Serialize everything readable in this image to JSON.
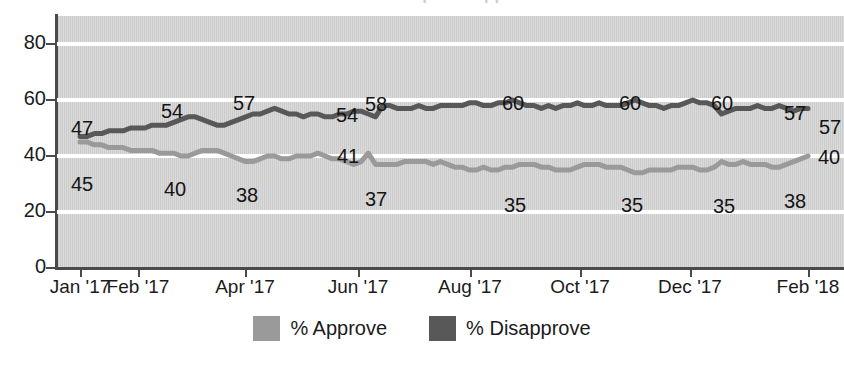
{
  "title_sliver": "President Trump Job Approval",
  "chart_data": {
    "type": "line",
    "title": "President Trump Job Approval",
    "xlabel": "",
    "ylabel": "",
    "ylim": [
      0,
      90
    ],
    "yticks": [
      0,
      20,
      40,
      60,
      80
    ],
    "ytick_labels": [
      "0",
      "20",
      "40",
      "60",
      "80"
    ],
    "grid": "horizontal-white",
    "legend_position": "bottom-center",
    "xtick_labels": [
      "Jan '17",
      "Feb '17",
      "Apr '17",
      "Jun '17",
      "Aug '17",
      "Oct '17",
      "Dec '17",
      "Feb '18"
    ],
    "xtick_positions": [
      80,
      138,
      245,
      358,
      470,
      580,
      690,
      808
    ],
    "colors": {
      "approve": "#9a9a9a",
      "disapprove": "#585858",
      "plot_background": "#d2d2d2",
      "gridline": "#ffffff",
      "axis": "#4a4a4a",
      "text": "#1b1b1b"
    },
    "series": [
      {
        "name": "% Approve",
        "color": "#9a9a9a",
        "values": [
          45,
          45,
          44,
          44,
          43,
          43,
          43,
          42,
          42,
          42,
          42,
          41,
          41,
          41,
          40,
          40,
          41,
          42,
          42,
          42,
          41,
          40,
          39,
          38,
          38,
          39,
          40,
          40,
          39,
          39,
          40,
          40,
          40,
          41,
          40,
          39,
          39,
          38,
          37,
          38,
          41,
          37,
          37,
          37,
          37,
          38,
          38,
          38,
          38,
          37,
          38,
          37,
          36,
          36,
          35,
          35,
          36,
          35,
          35,
          36,
          36,
          37,
          37,
          37,
          36,
          36,
          35,
          35,
          35,
          36,
          37,
          37,
          37,
          36,
          36,
          36,
          35,
          34,
          34,
          35,
          35,
          35,
          35,
          36,
          36,
          36,
          35,
          35,
          36,
          38,
          37,
          37,
          38,
          37,
          37,
          37,
          36,
          36,
          37,
          38,
          39,
          40
        ]
      },
      {
        "name": "% Disapprove",
        "color": "#585858",
        "values": [
          47,
          47,
          48,
          48,
          49,
          49,
          49,
          50,
          50,
          50,
          51,
          51,
          51,
          52,
          53,
          54,
          54,
          53,
          52,
          51,
          51,
          52,
          53,
          54,
          55,
          55,
          56,
          57,
          56,
          55,
          55,
          54,
          55,
          55,
          54,
          54,
          55,
          55,
          56,
          56,
          55,
          54,
          58,
          58,
          57,
          57,
          57,
          58,
          57,
          57,
          58,
          58,
          58,
          58,
          59,
          59,
          58,
          58,
          59,
          59,
          60,
          59,
          58,
          58,
          57,
          58,
          57,
          58,
          58,
          59,
          58,
          58,
          59,
          58,
          58,
          58,
          59,
          60,
          59,
          58,
          58,
          57,
          58,
          58,
          59,
          60,
          59,
          59,
          58,
          55,
          56,
          57,
          57,
          57,
          58,
          57,
          57,
          58,
          57,
          56,
          57,
          57
        ]
      }
    ],
    "annotations": [
      {
        "label": "47",
        "series": "% Disapprove",
        "x": 82,
        "y": 128,
        "align": "center"
      },
      {
        "label": "45",
        "series": "% Approve",
        "x": 82,
        "y": 184,
        "align": "center"
      },
      {
        "label": "54",
        "series": "% Disapprove",
        "x": 172,
        "y": 111,
        "align": "center"
      },
      {
        "label": "40",
        "series": "% Approve",
        "x": 175,
        "y": 189,
        "align": "center"
      },
      {
        "label": "57",
        "series": "% Disapprove",
        "x": 244,
        "y": 103,
        "align": "center"
      },
      {
        "label": "38",
        "series": "% Approve",
        "x": 247,
        "y": 195,
        "align": "center"
      },
      {
        "label": "54",
        "series": "% Disapprove",
        "x": 347,
        "y": 115,
        "align": "center"
      },
      {
        "label": "58",
        "series": "% Disapprove",
        "x": 376,
        "y": 104,
        "align": "center"
      },
      {
        "label": "41",
        "series": "% Approve",
        "x": 348,
        "y": 156,
        "align": "center"
      },
      {
        "label": "37",
        "series": "% Approve",
        "x": 376,
        "y": 199,
        "align": "center"
      },
      {
        "label": "60",
        "series": "% Disapprove",
        "x": 513,
        "y": 103,
        "align": "center"
      },
      {
        "label": "35",
        "series": "% Approve",
        "x": 515,
        "y": 205,
        "align": "center"
      },
      {
        "label": "60",
        "series": "% Disapprove",
        "x": 630,
        "y": 103,
        "align": "center"
      },
      {
        "label": "35",
        "series": "% Approve",
        "x": 632,
        "y": 205,
        "align": "center"
      },
      {
        "label": "60",
        "series": "% Disapprove",
        "x": 722,
        "y": 103,
        "align": "center"
      },
      {
        "label": "35",
        "series": "% Approve",
        "x": 724,
        "y": 206,
        "align": "center"
      },
      {
        "label": "57",
        "series": "% Disapprove",
        "x": 795,
        "y": 113,
        "align": "center"
      },
      {
        "label": "57",
        "series": "% Disapprove",
        "x": 819,
        "y": 127,
        "align": "right"
      },
      {
        "label": "40",
        "series": "% Approve",
        "x": 818,
        "y": 157,
        "align": "right"
      },
      {
        "label": "38",
        "series": "% Approve",
        "x": 795,
        "y": 201,
        "align": "center"
      }
    ]
  },
  "legend": {
    "items": [
      {
        "label": "% Approve",
        "color": "#9a9a9a"
      },
      {
        "label": "% Disapprove",
        "color": "#585858"
      }
    ]
  }
}
